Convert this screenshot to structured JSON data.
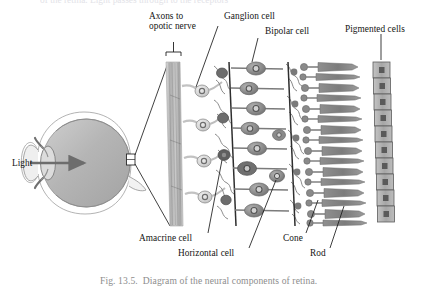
{
  "figure": {
    "title_clipped_top": "of the retina. Light passes through to the receptors",
    "caption": "Fig. 13.5.  Diagram of the neural components of retina.",
    "eye": {
      "light_label": "Light",
      "detail_box_note": "retina-detail-box"
    },
    "labels": [
      {
        "id": "axons",
        "text": "Axons to\nopotic nerve",
        "line1": "Axons to",
        "line2": "opotic nerve"
      },
      {
        "id": "ganglion",
        "text": "Ganglion cell"
      },
      {
        "id": "bipolar",
        "text": "Bipolar cell"
      },
      {
        "id": "pigmented",
        "text": "Pigmented cells"
      },
      {
        "id": "amacrine",
        "text": "Amacrine cell"
      },
      {
        "id": "horizontal",
        "text": "Horizontal cell"
      },
      {
        "id": "cone",
        "text": "Cone"
      },
      {
        "id": "rod",
        "text": "Rod"
      }
    ],
    "colors": {
      "ink": "#1b1b1b",
      "cell_gray": "#9a9a9a",
      "cell_dark": "#6a6a6a",
      "nucleus": "#4e4e4e",
      "eye_fill": "#b9b9b9",
      "paper": "#ffffff",
      "caption_gray": "#8d8d8d"
    }
  }
}
